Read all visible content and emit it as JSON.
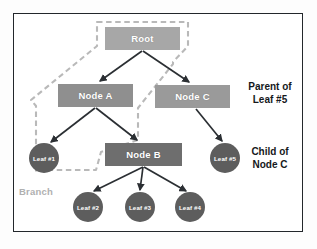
{
  "figure": {
    "type": "tree-diagram",
    "background_color": "#ffffff",
    "frame_color": "#23272b"
  },
  "nodes": [
    {
      "id": "root",
      "label": "Root",
      "shape": "rectangle",
      "color": "#a7a7a7"
    },
    {
      "id": "node_a",
      "label": "Node A",
      "shape": "rectangle",
      "color": "#8f8f8f"
    },
    {
      "id": "node_c",
      "label": "Node C",
      "shape": "rectangle",
      "color": "#9a9a9a"
    },
    {
      "id": "node_b",
      "label": "Node B",
      "shape": "rectangle",
      "color": "#6e6e6e"
    },
    {
      "id": "leaf_1",
      "label": "Leaf #1",
      "shape": "circle",
      "color": "#5d5d5d"
    },
    {
      "id": "leaf_2",
      "label": "Leaf #2",
      "shape": "circle",
      "color": "#5d5d5d"
    },
    {
      "id": "leaf_3",
      "label": "Leaf #3",
      "shape": "circle",
      "color": "#5d5d5d"
    },
    {
      "id": "leaf_4",
      "label": "Leaf #4",
      "shape": "circle",
      "color": "#5d5d5d"
    },
    {
      "id": "leaf_5",
      "label": "Leaf #5",
      "shape": "circle",
      "color": "#5d5d5d"
    }
  ],
  "edges": [
    {
      "from": "root",
      "to": "node_a"
    },
    {
      "from": "root",
      "to": "node_c"
    },
    {
      "from": "node_a",
      "to": "leaf_1"
    },
    {
      "from": "node_a",
      "to": "node_b"
    },
    {
      "from": "node_c",
      "to": "leaf_5"
    },
    {
      "from": "node_b",
      "to": "leaf_2"
    },
    {
      "from": "node_b",
      "to": "leaf_3"
    },
    {
      "from": "node_b",
      "to": "leaf_4"
    }
  ],
  "annotations": {
    "parent_of": "Parent of\nLeaf #5",
    "child_of": "Child of\nNode C",
    "branch": "Branch"
  },
  "highlight": {
    "name": "branch-outline",
    "style": "dashed",
    "color": "#b9b9b9",
    "encloses": [
      "root",
      "node_a",
      "leaf_1",
      "node_b"
    ]
  },
  "edge_style": {
    "color": "#2b2f33",
    "arrowhead": "filled-triangle"
  }
}
